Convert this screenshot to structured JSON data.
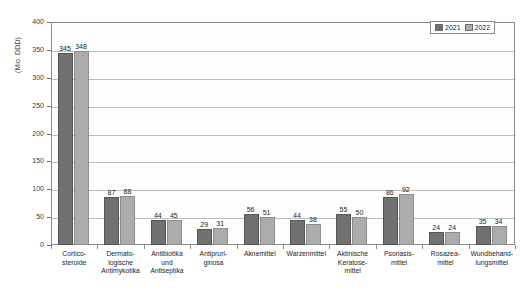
{
  "chart_data": {
    "type": "bar",
    "title": "",
    "subtitle": "",
    "xlabel": "",
    "ylabel": "(Mio. DDD)",
    "ylim": [
      0,
      400
    ],
    "ytick_step": 50,
    "yticks": [
      "400",
      "350",
      "300",
      "250",
      "200",
      "150",
      "100",
      "50",
      "0"
    ],
    "grid": true,
    "legend_position": "top-right",
    "categories": [
      "Cortico-\nsteroide",
      "Dermato-\nlogische\nAntimykotika",
      "Antibiotika\nund\nAntiseptika",
      "Antipruri-\nginosa",
      "Aknemittel",
      "Warzenmittel",
      "Aktinische\nKeratose-\nmittel",
      "Psoriasis-\nmittel",
      "Rosazea-\nmittel",
      "Wundbehand-\nlungsmittel"
    ],
    "category_lines": [
      [
        "Cortico-",
        "steroide"
      ],
      [
        "Dermato-",
        "logische",
        "Antimykotika"
      ],
      [
        "Antibiotika",
        "und",
        "Antiseptika"
      ],
      [
        "Antipruri-",
        "ginosa"
      ],
      [
        "Aknemittel"
      ],
      [
        "Warzenmittel"
      ],
      [
        "Aktinische",
        "Keratose-",
        "mittel"
      ],
      [
        "Psoriasis-",
        "mittel"
      ],
      [
        "Rosazea-",
        "mittel"
      ],
      [
        "Wundbehand-",
        "lungsmittel"
      ]
    ],
    "series": [
      {
        "name": "2021",
        "color": "#717171",
        "values": [
          345,
          87,
          44,
          29,
          56,
          44,
          55,
          86,
          24,
          35
        ]
      },
      {
        "name": "2022",
        "color": "#acacac",
        "values": [
          348,
          88,
          45,
          31,
          51,
          38,
          50,
          92,
          24,
          34
        ]
      }
    ]
  },
  "legend": {
    "entries": [
      {
        "label": "2021",
        "color": "#717171"
      },
      {
        "label": "2022",
        "color": "#acacac"
      }
    ]
  },
  "colors": {
    "series_2021": "#717171",
    "series_2022": "#acacac",
    "gridline": "#b9bcc4",
    "axis": "#8a8a8a",
    "text": "#1d1d1d",
    "background": "#ffffff"
  }
}
